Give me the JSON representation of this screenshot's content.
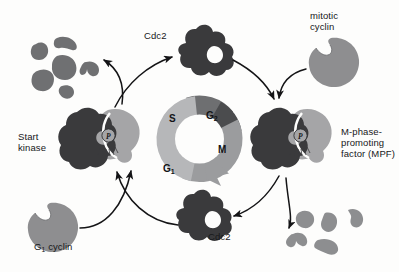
{
  "figure": {
    "background_color": "#fdfdfc",
    "colors": {
      "kinase_dark": "#3a3a3c",
      "cyclin_gray": "#8e8e90",
      "cyclin_light": "#a5a5a7",
      "fragment_gray": "#6f7072",
      "fragment_light": "#8d8e90",
      "arrow": "#141416",
      "wheel_s": "#6e6f71",
      "wheel_g2": "#4b4c4e",
      "wheel_m": "#9b9c9e",
      "wheel_g1": "#b6b7b9",
      "text": "#17181a"
    }
  },
  "wheel": {
    "name": "cell-cycle-wheel",
    "segments": [
      {
        "id": "S",
        "label": "S",
        "color": "#6e6f71",
        "start_deg": 270,
        "end_deg": 340
      },
      {
        "id": "G2",
        "label": "G",
        "sub": "2",
        "color": "#4b4c4e",
        "start_deg": 340,
        "end_deg": 30
      },
      {
        "id": "M",
        "label": "M",
        "color": "#9b9c9e",
        "start_deg": 30,
        "end_deg": 120
      },
      {
        "id": "G1",
        "label": "G",
        "sub": "1",
        "color": "#b6b7b9",
        "start_deg": 120,
        "end_deg": 270
      }
    ],
    "direction": "clockwise",
    "has_arrowhead": true
  },
  "labels": {
    "cdc2_top": "Cdc2",
    "cdc2_bottom": "Cdc2",
    "mitotic_cyclin_line1": "mitotic",
    "mitotic_cyclin_line2": "cyclin",
    "g1_cyclin": "G",
    "g1_cyclin_sub": "1",
    "g1_cyclin_rest": " cyclin",
    "start_kinase_line1": "Start",
    "start_kinase_line2": "kinase",
    "mpf_line1": "M-phase-",
    "mpf_line2": "promoting",
    "mpf_line3": "factor (MPF)",
    "phosphate": "P"
  },
  "elements": {
    "cdc2_top": "cdc2-protein-top",
    "cdc2_bottom": "cdc2-protein-bottom",
    "mitotic_cyclin": "mitotic-cyclin-shape",
    "g1_cyclin": "g1-cyclin-shape",
    "start_kinase": "start-kinase-complex",
    "mpf_complex": "mpf-complex",
    "degraded_cyclin_top_left": "degraded-cyclin-fragments-top-left",
    "degraded_cyclin_bottom_right": "degraded-cyclin-fragments-bottom-right"
  },
  "arrows": [
    {
      "name": "arrow-mitotic-cyclin-to-mpf",
      "from": "mitotic cyclin",
      "to": "MPF complex"
    },
    {
      "name": "arrow-cdc2-top-to-mpf",
      "from": "Cdc2 (top)",
      "to": "MPF complex"
    },
    {
      "name": "arrow-mpf-to-cdc2-bottom",
      "from": "MPF complex",
      "to": "Cdc2 (bottom)"
    },
    {
      "name": "arrow-mpf-to-degraded-cyclin",
      "from": "MPF complex",
      "to": "degraded cyclin fragments"
    },
    {
      "name": "arrow-g1-cyclin-to-start-kinase",
      "from": "G1 cyclin",
      "to": "Start kinase"
    },
    {
      "name": "arrow-cdc2-bottom-to-start-kinase",
      "from": "Cdc2 (bottom)",
      "to": "Start kinase"
    },
    {
      "name": "arrow-start-kinase-to-cdc2-top",
      "from": "Start kinase",
      "to": "Cdc2 (top)"
    },
    {
      "name": "arrow-start-kinase-to-degraded-cyclin",
      "from": "Start kinase",
      "to": "degraded cyclin fragments"
    }
  ]
}
